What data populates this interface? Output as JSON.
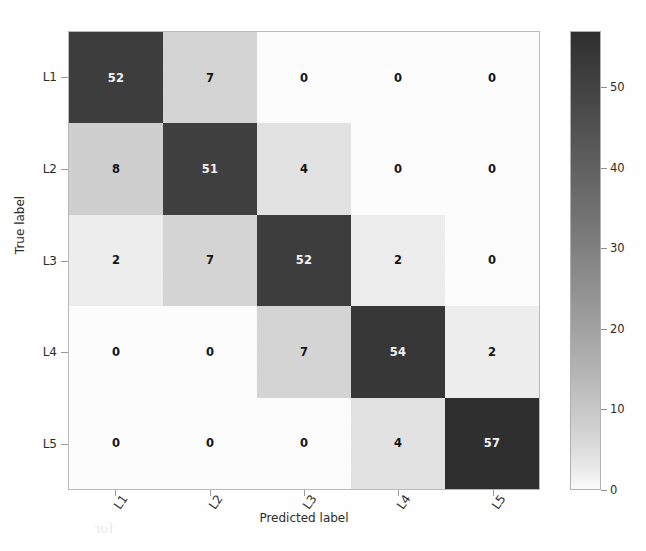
{
  "figure": {
    "xlabel": "Predicted label",
    "ylabel": "True label"
  },
  "axes": {
    "x_ticks": [
      "L1",
      "L2",
      "L3",
      "L4",
      "L5"
    ],
    "y_ticks": [
      "L1",
      "L2",
      "L3",
      "L4",
      "L5"
    ]
  },
  "colorbar": {
    "ticks": [
      "0",
      "10",
      "20",
      "30",
      "40",
      "50"
    ],
    "min": 0,
    "max": 57,
    "low_color": "#ffffff",
    "high_color": "#2f2f2f"
  },
  "cells": {
    "r0": [
      "52",
      "7",
      "0",
      "0",
      "0"
    ],
    "r1": [
      "8",
      "51",
      "4",
      "0",
      "0"
    ],
    "r2": [
      "2",
      "7",
      "52",
      "2",
      "0"
    ],
    "r3": [
      "0",
      "0",
      "7",
      "54",
      "2"
    ],
    "r4": [
      "0",
      "0",
      "0",
      "4",
      "57"
    ]
  },
  "bleed_text": {
    "l1": "characterization",
    "l2": "of small proper",
    "l3": "Orders a serial",
    "l4": "approximation to",
    "l5": "the measurements",
    "l6": "identification of",
    "l7": "feature components",
    "l8": "for",
    "l9": "with the results"
  },
  "chart_data": {
    "type": "heatmap",
    "title": "",
    "xlabel": "Predicted label",
    "ylabel": "True label",
    "x_categories": [
      "L1",
      "L2",
      "L3",
      "L4",
      "L5"
    ],
    "y_categories": [
      "L1",
      "L2",
      "L3",
      "L4",
      "L5"
    ],
    "matrix": [
      [
        52,
        7,
        0,
        0,
        0
      ],
      [
        8,
        51,
        4,
        0,
        0
      ],
      [
        2,
        7,
        52,
        2,
        0
      ],
      [
        0,
        0,
        7,
        54,
        2
      ],
      [
        0,
        0,
        0,
        4,
        57
      ]
    ],
    "colormap": "Greys",
    "cmin": 0,
    "cmax": 57,
    "colorbar_ticks": [
      0,
      10,
      20,
      30,
      40,
      50
    ],
    "grid": false,
    "legend": "colorbar-right",
    "annotations": "cell values shown, light text on dark cells"
  }
}
